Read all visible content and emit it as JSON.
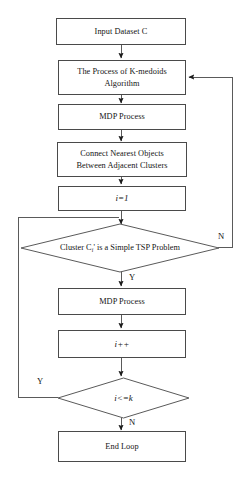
{
  "diagram": {
    "type": "flowchart",
    "stroke_color": "#4a4a4a",
    "text_color": "#141414",
    "background": "#ffffff",
    "nodes": {
      "input_dataset": "Input Dataset C",
      "kmedoids_line1": "The Process of K-medoids",
      "kmedoids_line2": "Algorithm",
      "mdp_process_1": "MDP Process",
      "connect_line1": "Connect Nearest Objects",
      "connect_line2": "Between Adjacent Clusters",
      "init_i": "i=1",
      "decision_tsp": "Cluster Cᵢ' is a Simple TSP Problem",
      "decision_tsp_prefix": "Cluster C",
      "decision_tsp_subscript": "i",
      "decision_tsp_suffix": "' is a Simple TSP Problem",
      "mdp_process_2": "MDP Process",
      "increment_i": "i++",
      "decision_loop": "i<=k",
      "end_loop": "End Loop"
    },
    "edge_labels": {
      "tsp_no": "N",
      "tsp_yes": "Y",
      "loop_yes": "Y",
      "loop_no": "N"
    }
  }
}
